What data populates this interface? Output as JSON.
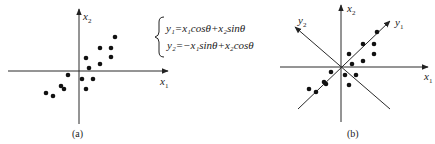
{
  "panel_a": {
    "caption": "(a)",
    "x_axis_label": "x",
    "x_axis_sub": "1",
    "y_axis_label": "x",
    "y_axis_sub": "2",
    "points": [
      [
        115,
        37
      ],
      [
        100,
        48
      ],
      [
        111,
        48
      ],
      [
        86,
        58
      ],
      [
        111,
        57
      ],
      [
        89,
        68
      ],
      [
        100,
        64
      ],
      [
        68,
        75
      ],
      [
        82,
        79
      ],
      [
        93,
        79
      ],
      [
        61,
        86
      ],
      [
        64,
        89
      ],
      [
        86,
        89
      ],
      [
        46,
        93
      ],
      [
        53,
        96
      ]
    ]
  },
  "equations": {
    "line1": "y₁=x₁cosθ+x₂sinθ",
    "line2": "y₂=−x₁sinθ+x₂cosθ"
  },
  "panel_b": {
    "caption": "(b)",
    "x1_label": "x",
    "x1_sub": "1",
    "x2_label": "x",
    "x2_sub": "2",
    "y1_label": "y",
    "y1_sub": "1",
    "y2_label": "y",
    "y2_sub": "2",
    "points": [
      [
        377,
        32
      ],
      [
        363,
        44
      ],
      [
        374,
        44
      ],
      [
        349,
        54
      ],
      [
        374,
        54
      ],
      [
        352,
        64
      ],
      [
        363,
        61
      ],
      [
        331,
        72
      ],
      [
        345,
        75
      ],
      [
        356,
        75
      ],
      [
        349,
        85
      ],
      [
        324,
        82
      ],
      [
        326,
        84
      ],
      [
        309,
        89
      ],
      [
        316,
        92
      ]
    ]
  },
  "colors": {
    "ink": "#222222",
    "background": "#ffffff"
  }
}
